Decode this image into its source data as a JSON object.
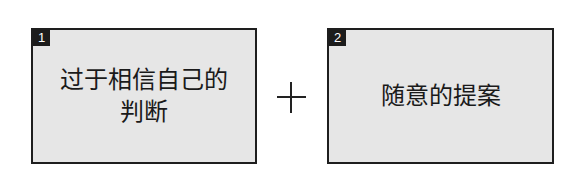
{
  "boxes": [
    {
      "number": "1",
      "lines": [
        "过于相信自己的",
        "判断"
      ]
    },
    {
      "number": "2",
      "lines": [
        "随意的提案"
      ]
    }
  ],
  "operator": "+",
  "colors": {
    "box_fill": "#e6e6e6",
    "border": "#1e1e1e",
    "badge": "#1c1c1c",
    "text": "#1a1a1a"
  }
}
